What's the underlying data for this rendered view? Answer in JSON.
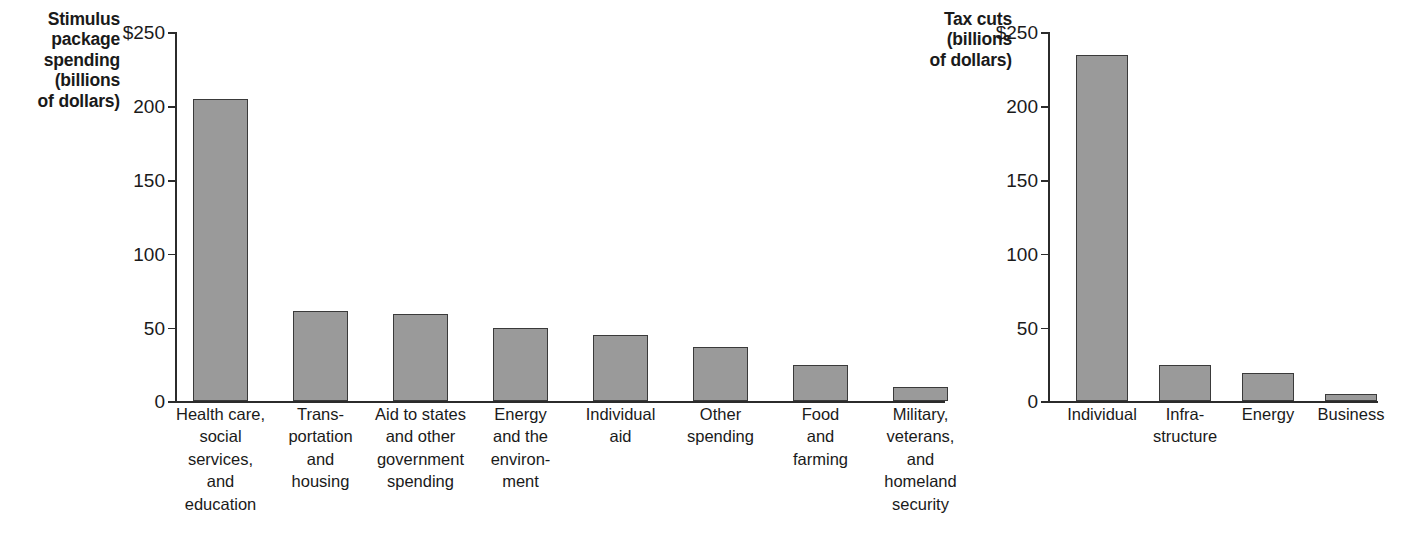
{
  "chart_data": [
    {
      "type": "bar",
      "title": "Stimulus package spending (billions of dollars)",
      "title_lines": "Stimulus\npackage\nspending\n(billions\nof dollars)",
      "xlabel": "",
      "ylabel": "billions of dollars",
      "ylim": [
        0,
        250
      ],
      "yticks": [
        0,
        50,
        100,
        150,
        200,
        250
      ],
      "ytick_labels": [
        "0",
        "50",
        "100",
        "150",
        "200",
        "$250"
      ],
      "grid": false,
      "legend": "none",
      "bar_color": "#9a9a9a",
      "bar_edge_color": "#3a3a3a",
      "categories": [
        "Health care,\nsocial services,\nand education",
        "Trans-\nportation\nand\nhousing",
        "Aid to states\nand other\ngovernment\nspending",
        "Energy\nand the\nenviron-\nment",
        "Individual\naid",
        "Other\nspending",
        "Food\nand\nfarming",
        "Military,\nveterans,\nand\nhomeland\nsecurity"
      ],
      "values": [
        205,
        61,
        59,
        50,
        45,
        37,
        25,
        10
      ]
    },
    {
      "type": "bar",
      "title": "Tax cuts (billions of dollars)",
      "title_lines": "Tax cuts\n(billions\nof dollars)",
      "xlabel": "",
      "ylabel": "billions of dollars",
      "ylim": [
        0,
        250
      ],
      "yticks": [
        0,
        50,
        100,
        150,
        200,
        250
      ],
      "ytick_labels": [
        "0",
        "50",
        "100",
        "150",
        "200",
        "$250"
      ],
      "grid": false,
      "legend": "none",
      "bar_color": "#9a9a9a",
      "bar_edge_color": "#3a3a3a",
      "categories": [
        "Individual",
        "Infra-\nstructure",
        "Energy",
        "Business"
      ],
      "values": [
        235,
        25,
        19,
        5
      ]
    }
  ]
}
